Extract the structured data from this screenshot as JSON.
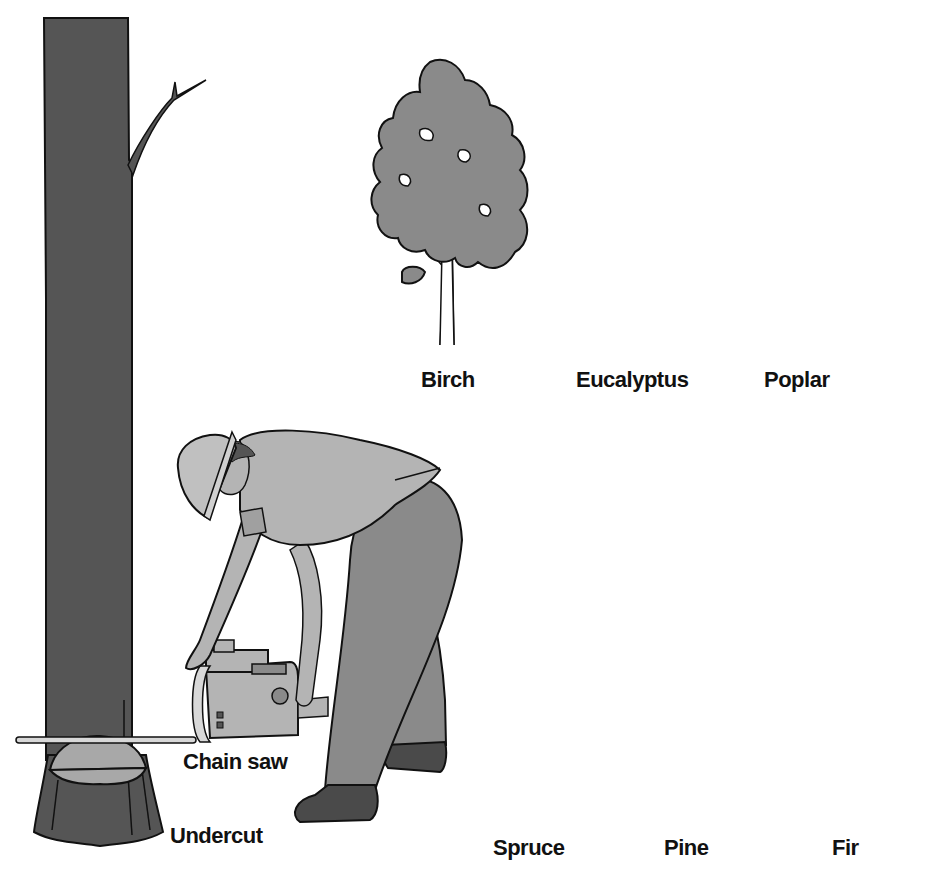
{
  "colors": {
    "trunk": "#555555",
    "light_gray": "#a8a8a8",
    "mid_gray": "#8a8a8a",
    "dark_gray": "#4a4a4a",
    "black": "#0a0a0a",
    "outline": "#111111",
    "background": "#ffffff"
  },
  "felling_scene": {
    "labels": {
      "chain_saw": "Chain saw",
      "undercut": "Undercut"
    }
  },
  "tree_types": {
    "deciduous": [
      {
        "name": "Birch",
        "fill": "mid_gray"
      },
      {
        "name": "Eucalyptus",
        "fill": "black"
      },
      {
        "name": "Poplar",
        "fill": "light_gray"
      }
    ],
    "conifers": [
      {
        "name": "Spruce",
        "fill": "mid_gray"
      },
      {
        "name": "Pine",
        "fill": "dark_gray"
      },
      {
        "name": "Fir",
        "fill": "mid_gray"
      }
    ]
  }
}
